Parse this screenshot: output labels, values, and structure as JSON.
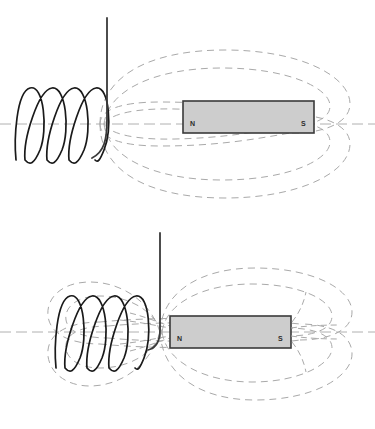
{
  "figure": {
    "background_color": "#ffffff",
    "width": 375,
    "height": 429,
    "panel_count": 2
  },
  "colors": {
    "magnet_fill": "#cdcdcd",
    "magnet_stroke": "#3a3a3a",
    "field_line": "#a9a9a9",
    "axis_line": "#b0b0b0",
    "coil_wire": "#1a1a1a",
    "lead_wire": "#3a3a3a",
    "label_text": "#2b2b2b"
  },
  "panels": [
    {
      "name": "coil-separated-from-magnet",
      "magnet": {
        "name": "bar-magnet",
        "north_label": "N",
        "south_label": "S",
        "x": 183,
        "y": 101,
        "width": 131,
        "height": 32
      },
      "coil": {
        "name": "solenoid-coil",
        "turns": 5,
        "center_y": 124,
        "left_x": 16,
        "right_x": 104,
        "loop_height": 72,
        "loop_width": 23
      },
      "lead_wire": {
        "name": "lead-wire",
        "x": 107,
        "top_y": 18,
        "bottom_y": 150
      },
      "axis": {
        "name": "center-axis",
        "y": 124,
        "x_start": 0,
        "x_end": 375
      },
      "field_lines": {
        "name": "magnetic-field-lines",
        "loops": 2,
        "threads_coil": false
      }
    },
    {
      "name": "coil-touching-magnet",
      "magnet": {
        "name": "bar-magnet",
        "north_label": "N",
        "south_label": "S",
        "x": 170,
        "y": 316,
        "width": 121,
        "height": 32
      },
      "coil": {
        "name": "solenoid-coil",
        "turns": 5,
        "center_y": 332,
        "left_x": 56,
        "right_x": 145,
        "loop_height": 72,
        "loop_width": 23
      },
      "lead_wire": {
        "name": "lead-wire",
        "x": 160,
        "top_y": 233,
        "bottom_y": 348
      },
      "axis": {
        "name": "center-axis",
        "y": 332,
        "x_start": 0,
        "x_end": 375
      },
      "field_lines": {
        "name": "magnetic-field-lines",
        "loops": 2,
        "threads_coil": true
      }
    }
  ]
}
